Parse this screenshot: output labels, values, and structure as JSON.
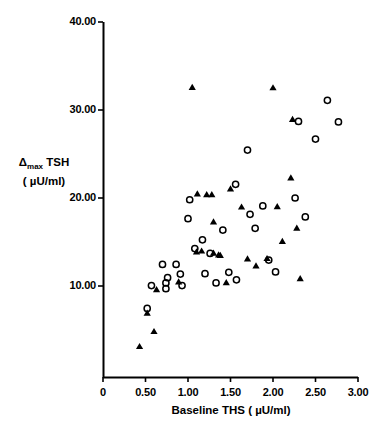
{
  "chart_data": {
    "type": "scatter",
    "title": "",
    "xlabel": "Baseline THS ( µU/ml)",
    "ylabel_line1": "Δ max TSH",
    "ylabel_line2": "( µU/ml)",
    "ylabel_delta": "Δ",
    "ylabel_sub": "max",
    "ylabel_rest": " TSH",
    "xlim": [
      0,
      3.0
    ],
    "ylim": [
      0,
      40.0
    ],
    "grid": false,
    "legend": "none",
    "xticks": [
      0,
      0.5,
      1.0,
      1.5,
      2.0,
      2.5,
      3.0
    ],
    "xtick_labels": [
      "0",
      "0.50",
      "1.00",
      "1.50",
      "2.00",
      "2.50",
      "3.00"
    ],
    "yticks": [
      10.0,
      20.0,
      30.0,
      40.0
    ],
    "ytick_labels": [
      "10.00",
      "20.00",
      "30.00",
      "40.00"
    ],
    "series": [
      {
        "name": "open-circle",
        "marker": "open-circle",
        "color": "#000000",
        "points": [
          [
            0.52,
            7.45
          ],
          [
            0.57,
            10.05
          ],
          [
            0.7,
            12.45
          ],
          [
            0.76,
            10.95
          ],
          [
            0.74,
            10.35
          ],
          [
            0.74,
            9.7
          ],
          [
            0.86,
            12.45
          ],
          [
            0.91,
            11.35
          ],
          [
            0.93,
            10.05
          ],
          [
            1.02,
            19.8
          ],
          [
            1.0,
            17.65
          ],
          [
            1.08,
            14.25
          ],
          [
            1.17,
            15.25
          ],
          [
            1.26,
            13.7
          ],
          [
            1.2,
            11.4
          ],
          [
            1.33,
            10.35
          ],
          [
            1.41,
            16.35
          ],
          [
            1.48,
            11.55
          ],
          [
            1.56,
            21.55
          ],
          [
            1.57,
            10.7
          ],
          [
            1.7,
            25.45
          ],
          [
            1.73,
            18.15
          ],
          [
            1.79,
            16.55
          ],
          [
            1.88,
            19.1
          ],
          [
            1.95,
            12.95
          ],
          [
            2.03,
            11.6
          ],
          [
            2.26,
            20.0
          ],
          [
            2.3,
            28.7
          ],
          [
            2.38,
            17.85
          ],
          [
            2.64,
            31.1
          ],
          [
            2.77,
            28.65
          ],
          [
            2.5,
            26.7
          ]
        ]
      },
      {
        "name": "filled-triangle",
        "marker": "filled-triangle",
        "color": "#000000",
        "points": [
          [
            0.43,
            3.1
          ],
          [
            0.52,
            6.9
          ],
          [
            0.6,
            4.8
          ],
          [
            0.63,
            9.55
          ],
          [
            0.89,
            10.45
          ],
          [
            1.05,
            32.55
          ],
          [
            1.1,
            13.85
          ],
          [
            1.11,
            20.45
          ],
          [
            1.16,
            13.95
          ],
          [
            1.22,
            20.35
          ],
          [
            1.28,
            20.35
          ],
          [
            1.3,
            13.7
          ],
          [
            1.36,
            13.5
          ],
          [
            1.38,
            13.45
          ],
          [
            1.3,
            17.25
          ],
          [
            1.45,
            10.35
          ],
          [
            1.5,
            21.0
          ],
          [
            1.63,
            18.95
          ],
          [
            1.7,
            13.05
          ],
          [
            1.8,
            12.25
          ],
          [
            2.0,
            32.5
          ],
          [
            2.05,
            19.0
          ],
          [
            2.11,
            15.05
          ],
          [
            2.21,
            22.25
          ],
          [
            2.23,
            28.9
          ],
          [
            2.28,
            16.55
          ],
          [
            2.32,
            10.8
          ],
          [
            1.93,
            13.1
          ]
        ]
      }
    ]
  },
  "axes": {
    "x_origin_px": 103,
    "y_origin_px": 377,
    "x_end_px": 358,
    "y_top_px": 22
  }
}
